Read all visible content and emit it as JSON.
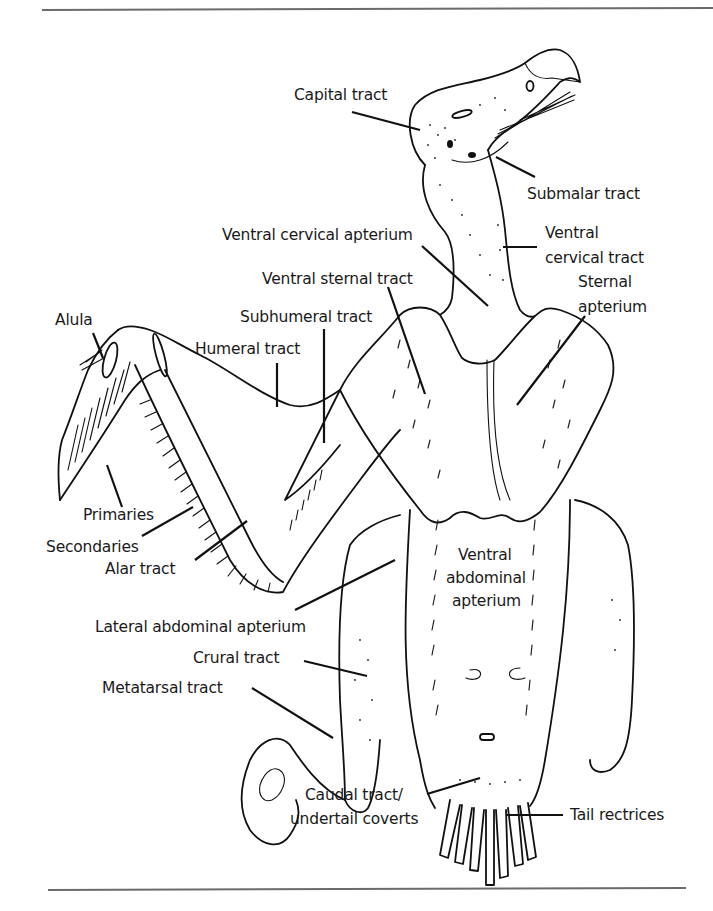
{
  "figure": {
    "labels": {
      "capital_tract": "Capital tract",
      "submalar_tract": "Submalar tract",
      "ventral_cervical_apterium": "Ventral cervical apterium",
      "ventral_cervical_tract_1": "Ventral",
      "ventral_cervical_tract_2": "cervical tract",
      "ventral_sternal_tract": "Ventral sternal tract",
      "sternal_apterium_1": "Sternal",
      "sternal_apterium_2": "apterium",
      "alula": "Alula",
      "subhumeral_tract": "Subhumeral tract",
      "humeral_tract": "Humeral tract",
      "primaries": "Primaries",
      "secondaries": "Secondaries",
      "alar_tract": "Alar tract",
      "ventral_abdominal_apterium_1": "Ventral",
      "ventral_abdominal_apterium_2": "abdominal",
      "ventral_abdominal_apterium_3": "apterium",
      "lateral_abdominal_apterium": "Lateral abdominal apterium",
      "crural_tract": "Crural tract",
      "metatarsal_tract": "Metatarsal tract",
      "caudal_tract_1": "Caudal tract/",
      "caudal_tract_2": "undertail coverts",
      "tail_rectrices": "Tail rectrices"
    },
    "colors": {
      "ink": "#111111",
      "rule": "#6b6b6b",
      "background": "#ffffff"
    }
  }
}
